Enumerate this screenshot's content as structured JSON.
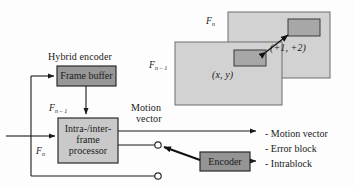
{
  "figure": {
    "background": "#fdfdfd",
    "ink": "#1a1a1a"
  },
  "captions": {
    "hybrid_encoder": "Hybrid encoder"
  },
  "blocks": {
    "frame_buffer": {
      "label": "Frame buffer",
      "fill": "#979797",
      "stroke": "#2b2b2b"
    },
    "processor": {
      "line1": "Intra-/inter-",
      "line2": "frame",
      "line3": "processor",
      "fill": "#c9c9c9",
      "stroke": "#2b2b2b"
    },
    "encoder": {
      "label": "Encoder",
      "fill": "#949494",
      "stroke": "#2b2b2b"
    }
  },
  "signals": {
    "fn_minus_1_left": {
      "base": "F",
      "sub": "n – 1"
    },
    "fn_left": {
      "base": "F",
      "sub": "n"
    },
    "motion_vector_line1": "Motion",
    "motion_vector_line2": "vector"
  },
  "outputs": [
    {
      "label": "- Motion vector"
    },
    {
      "label": "- Error block"
    },
    {
      "label": "- Intrablock"
    }
  ],
  "illustration": {
    "frame_current": {
      "name": "F",
      "sub": "n",
      "fill": "#d2d2d2",
      "stroke": "#6e6e6e"
    },
    "frame_previous": {
      "name": "F",
      "sub": "n – 1",
      "fill": "#d2d2d2",
      "stroke": "#6e6e6e"
    },
    "block_current": {
      "fill": "#a7a7a7",
      "stroke": "#3a3a3a"
    },
    "block_previous": {
      "fill": "#a7a7a7",
      "stroke": "#3a3a3a"
    },
    "coord_previous": "(x, y)",
    "coord_displacement": "(+1, +2)"
  },
  "terminals": {
    "count": 2,
    "fill": "#ffffff",
    "stroke": "#2b2b2b"
  }
}
